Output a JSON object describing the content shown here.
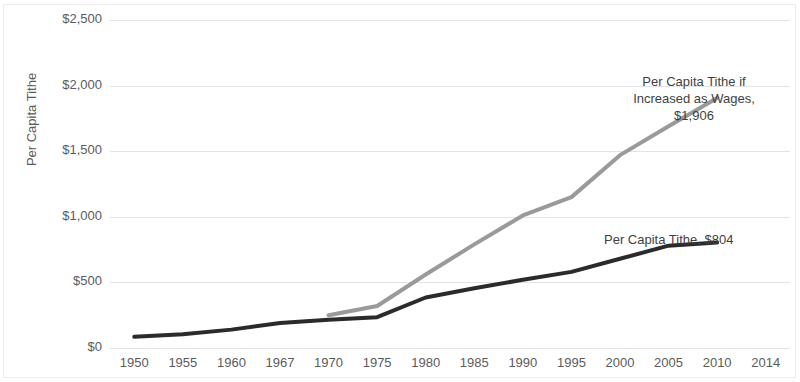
{
  "chart_data": {
    "type": "line",
    "title": "",
    "subtitle": "",
    "xlabel": "",
    "ylabel": "Per Capita Tithe",
    "categories": [
      "1950",
      "1955",
      "1960",
      "1967",
      "1970",
      "1975",
      "1980",
      "1985",
      "1990",
      "1995",
      "2000",
      "2005",
      "2010",
      "2014"
    ],
    "ylim": [
      0,
      2500
    ],
    "y_ticks": [
      0,
      500,
      1000,
      1500,
      2000,
      2500
    ],
    "y_tick_labels": [
      "$0",
      "$500",
      "$1,000",
      "$1,500",
      "$2,000",
      "$2,500"
    ],
    "grid": "horizontal",
    "legend": "none",
    "series": [
      {
        "name": "Per Capita Tithe",
        "color": "#2b2b2b",
        "width": 4,
        "values": [
          85,
          105,
          140,
          190,
          215,
          235,
          385,
          455,
          520,
          580,
          680,
          780,
          804,
          null
        ]
      },
      {
        "name": "Per Capita Tithe if Increased as Wages",
        "color": "#9a9a9a",
        "width": 4,
        "values": [
          null,
          null,
          null,
          null,
          250,
          320,
          560,
          790,
          1010,
          1150,
          1470,
          1690,
          1906,
          null
        ]
      }
    ],
    "annotations": [
      {
        "id": "wages",
        "text": "Per Capita Tithe if\nIncreased as Wages,\n$1,906",
        "value": 1906
      },
      {
        "id": "tithe",
        "text": "Per Capita Tithe, $804",
        "value": 804
      }
    ],
    "colors": {
      "gridline": "#e3e3e3",
      "axis_text": "#5b5b5b",
      "annotation_text": "#3f3f3f",
      "series_dark": "#2b2b2b",
      "series_gray": "#9a9a9a",
      "background": "#ffffff"
    }
  }
}
